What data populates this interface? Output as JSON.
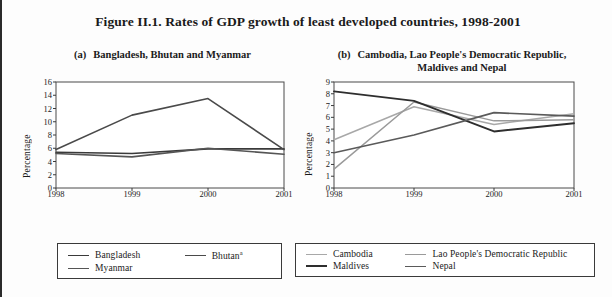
{
  "figure": {
    "title": "Figure II.1.  Rates of GDP growth of least developed countries, 1998-2001"
  },
  "panels": [
    {
      "tag": "(a)",
      "title": "Bangladesh, Bhutan and Myanmar"
    },
    {
      "tag": "(b)",
      "title": "Cambodia, Lao People's Democratic Republic,\nMaldives and Nepal"
    }
  ],
  "panel_b_title_line1": "Cambodia, Lao People's Democratic Republic,",
  "panel_b_title_line2": "Maldives and Nepal",
  "legend_a": {
    "items": [
      {
        "label": "Bangladesh",
        "sup": "",
        "color": "#3a3a3a"
      },
      {
        "label": "Bhutan",
        "sup": "a",
        "color": "#4a4a4a"
      },
      {
        "label": "Myanmar",
        "sup": "",
        "color": "#555555"
      }
    ]
  },
  "legend_b": {
    "items": [
      {
        "label": "Cambodia",
        "sup": "",
        "color": "#a8a8a8"
      },
      {
        "label": "Lao People's Democratic Republic",
        "sup": "",
        "color": "#9a9a9a"
      },
      {
        "label": "Maldives",
        "sup": "",
        "color": "#2e2e2e"
      },
      {
        "label": "Nepal",
        "sup": "",
        "color": "#5a5a5a"
      }
    ]
  },
  "chart_data": [
    {
      "type": "line",
      "title": "(a) Bangladesh, Bhutan and Myanmar",
      "xlabel": "",
      "ylabel": "Percentage",
      "x": [
        "1998",
        "1999",
        "2000",
        "2001"
      ],
      "xticks": [
        "1998",
        "1999",
        "2000",
        "2001"
      ],
      "yticks": [
        0,
        2,
        4,
        6,
        8,
        10,
        12,
        14,
        16
      ],
      "ylim": [
        0,
        16
      ],
      "grid": false,
      "legend_position": "below",
      "series": [
        {
          "name": "Bangladesh",
          "color": "#3a3a3a",
          "width": 1.6,
          "values": [
            5.4,
            5.2,
            5.9,
            5.9
          ]
        },
        {
          "name": "Bhutan",
          "color": "#4a4a4a",
          "width": 1.6,
          "values": [
            5.8,
            11.0,
            13.5,
            5.8
          ]
        },
        {
          "name": "Myanmar",
          "color": "#555555",
          "width": 1.6,
          "values": [
            5.2,
            4.7,
            6.0,
            5.1
          ]
        }
      ]
    },
    {
      "type": "line",
      "title": "(b) Cambodia, Lao People's Democratic Republic, Maldives and Nepal",
      "xlabel": "",
      "ylabel": "Percentage",
      "x": [
        "1998",
        "1999",
        "2000",
        "2001"
      ],
      "xticks": [
        "1998",
        "1999",
        "2000",
        "2001"
      ],
      "yticks": [
        0,
        1,
        2,
        3,
        4,
        5,
        6,
        7,
        8,
        9
      ],
      "ylim": [
        0,
        9
      ],
      "grid": false,
      "legend_position": "below",
      "series": [
        {
          "name": "Cambodia",
          "color": "#a8a8a8",
          "width": 1.5,
          "values": [
            4.1,
            6.9,
            5.4,
            6.3
          ]
        },
        {
          "name": "Lao People's Democratic Republic",
          "color": "#9a9a9a",
          "width": 1.5,
          "values": [
            1.6,
            7.3,
            5.7,
            5.8
          ]
        },
        {
          "name": "Maldives",
          "color": "#2e2e2e",
          "width": 1.9,
          "values": [
            8.2,
            7.4,
            4.8,
            5.5
          ]
        },
        {
          "name": "Nepal",
          "color": "#5a5a5a",
          "width": 1.6,
          "values": [
            3.0,
            4.5,
            6.4,
            6.1
          ]
        }
      ]
    }
  ]
}
